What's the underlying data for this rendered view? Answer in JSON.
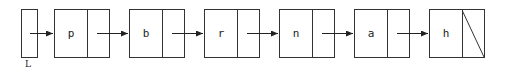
{
  "diagram": {
    "type": "singly-linked-list",
    "head_label": "L",
    "nodes": [
      {
        "value": "p"
      },
      {
        "value": "b"
      },
      {
        "value": "r"
      },
      {
        "value": "n"
      },
      {
        "value": "a"
      },
      {
        "value": "h"
      }
    ],
    "terminator": "null (diagonal slash in last pointer field)",
    "colors": {
      "stroke": "#333333",
      "background": "#ffffff",
      "text": "#222222"
    }
  }
}
